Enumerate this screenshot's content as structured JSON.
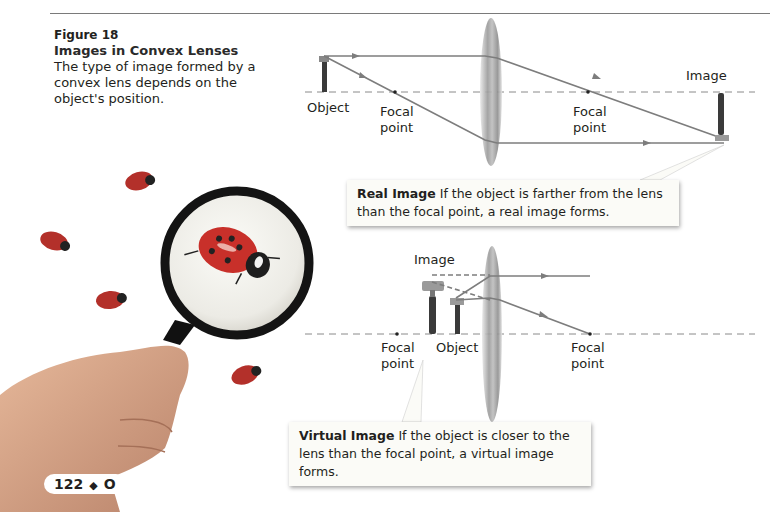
{
  "caption": {
    "figure_label": "Figure 18",
    "title": "Images in Convex Lenses",
    "text": "The type of image formed by a convex lens depends on the object's position."
  },
  "real_image_diagram": {
    "labels": {
      "object": "Object",
      "focal_left": "Focal point",
      "focal_right": "Focal point",
      "image": "Image"
    },
    "callout": {
      "title": "Real Image",
      "text": "If the object is farther from the lens than the focal point, a real image forms."
    }
  },
  "virtual_image_diagram": {
    "labels": {
      "image": "Image",
      "focal_left": "Focal point",
      "object": "Object",
      "focal_right": "Focal point"
    },
    "callout": {
      "title": "Virtual Image",
      "text": "If the object is closer to the lens than the focal point, a virtual image forms."
    }
  },
  "photo": {
    "subject": "hand holding magnifying glass over ladybugs",
    "ladybug_color": "#c8302a",
    "lens_frame_color": "#1a1a1a",
    "skin_color": "#d9a98a"
  },
  "page": {
    "number": "122",
    "separator": "◆",
    "section": "O"
  },
  "colors": {
    "ray": "#7d7d7d",
    "axis": "#8a8a8a",
    "callout_bg": "#fbfbf7"
  }
}
